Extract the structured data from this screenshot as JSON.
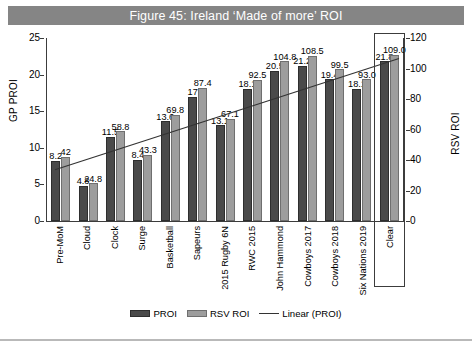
{
  "title": "Figure 45: Ireland ‘Made of more’ ROI",
  "colors": {
    "title_bar": "#858585",
    "title_text": "#ffffff",
    "proi_bar": "#4a4a4a",
    "rsv_bar": "#9d9d9d",
    "trendline": "#333333",
    "axis": "#3c3c3c"
  },
  "legend": {
    "items": [
      {
        "label": "PROI",
        "type": "bar",
        "color": "#4a4a4a"
      },
      {
        "label": "RSV ROI",
        "type": "bar",
        "color": "#9d9d9d"
      },
      {
        "label": "Linear (PROI)",
        "type": "line",
        "color": "#333333"
      }
    ]
  },
  "axes": {
    "left": {
      "title": "GP PROI",
      "min": 0,
      "max": 25,
      "ticks": [
        0,
        5,
        10,
        15,
        20,
        25
      ]
    },
    "right": {
      "title": "RSV ROI",
      "min": 0,
      "max": 120,
      "ticks": [
        0,
        20,
        40,
        60,
        80,
        100,
        120
      ]
    }
  },
  "highlight": {
    "category": "Clear",
    "boxed": true
  },
  "chart_data": {
    "type": "bar",
    "title": "Figure 45: Ireland ‘Made of more’ ROI",
    "xlabel": "",
    "ylabel": "GP PROI",
    "y2label": "RSV ROI",
    "ylim": [
      0,
      25
    ],
    "y2lim": [
      0,
      120
    ],
    "grid": false,
    "legend_position": "bottom",
    "categories": [
      "Pre-MoM",
      "Cloud",
      "Clock",
      "Surge",
      "Basketball",
      "Sapeurs",
      "2015 Rugby 6N",
      "RWC 2015",
      "John Hammond",
      "Cowboys 2017",
      "Cowboys 2018",
      "Six Nations 2019",
      "Clear"
    ],
    "series": [
      {
        "name": "PROI",
        "axis": "left",
        "color": "#4a4a4a",
        "values": [
          8.2,
          4.8,
          11.5,
          8.4,
          13.6,
          17,
          13.1,
          18.1,
          20.5,
          21.2,
          19.4,
          18.1,
          21.8
        ],
        "labels": [
          "8.2",
          "4.8",
          "11.5",
          "8.4",
          "13.6",
          "17",
          "13.1",
          "18.1",
          "20.5",
          "21.2",
          "19.4",
          "18.1",
          "21.8"
        ]
      },
      {
        "name": "RSV ROI",
        "axis": "right",
        "color": "#9d9d9d",
        "values": [
          42,
          24.8,
          58.8,
          43.3,
          69.8,
          87.4,
          67.1,
          92.5,
          104.8,
          108.5,
          99.5,
          93.0,
          109.0
        ],
        "labels": [
          "42",
          "24.8",
          "58.8",
          "43.3",
          "69.8",
          "87.4",
          "67.1",
          "92.5",
          "104.8",
          "108.5",
          "99.5",
          "93.0",
          "109.0"
        ]
      }
    ],
    "trendline": {
      "name": "Linear (PROI)",
      "color": "#333333",
      "start_value": 7.0,
      "end_value": 22.2
    }
  }
}
